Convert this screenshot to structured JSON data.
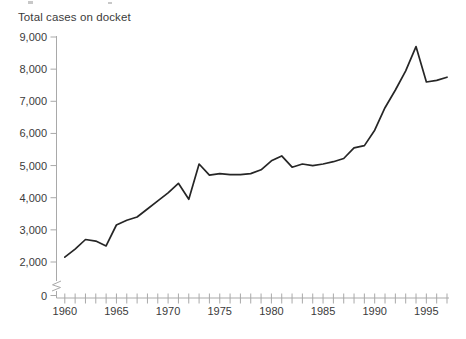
{
  "chart_data": {
    "type": "line",
    "title": "Total cases on docket",
    "x": [
      1960,
      1961,
      1962,
      1963,
      1964,
      1965,
      1966,
      1967,
      1968,
      1969,
      1970,
      1971,
      1972,
      1973,
      1974,
      1975,
      1976,
      1977,
      1978,
      1979,
      1980,
      1981,
      1982,
      1983,
      1984,
      1985,
      1986,
      1987,
      1988,
      1989,
      1990,
      1991,
      1992,
      1993,
      1994,
      1995,
      1996,
      1997
    ],
    "values": [
      2150,
      2400,
      2700,
      2650,
      2500,
      3150,
      3300,
      3400,
      3650,
      3900,
      4150,
      4450,
      3950,
      5050,
      4700,
      4750,
      4720,
      4720,
      4750,
      4870,
      5150,
      5300,
      4950,
      5050,
      5000,
      5050,
      5120,
      5220,
      5550,
      5620,
      6100,
      6800,
      7350,
      7950,
      8700,
      7600,
      7650,
      7750
    ],
    "xlabel": "",
    "ylabel": "",
    "x_tick_years": [
      1960,
      1965,
      1970,
      1975,
      1980,
      1985,
      1990,
      1995
    ],
    "x_tick_labels": [
      "1960",
      "1965",
      "1970",
      "1975",
      "1980",
      "1985",
      "1990",
      "1995"
    ],
    "y_tick_values": [
      9000,
      8000,
      7000,
      6000,
      5000,
      4000,
      3000,
      2000,
      0
    ],
    "y_tick_labels": [
      "9,000",
      "8,000",
      "7,000",
      "6,000",
      "5,000",
      "4,000",
      "3,000",
      "2,000",
      "0"
    ],
    "ylim": [
      0,
      9000
    ],
    "xlim": [
      1960,
      1997
    ],
    "axis_break_between": [
      0,
      2000
    ],
    "grid": false,
    "legend": null,
    "line_color": "#262626",
    "axis_color": "#a9a9a9",
    "label_color": "#3b3b3b"
  }
}
